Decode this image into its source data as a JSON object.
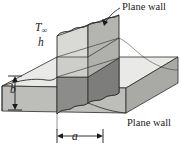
{
  "figure": {
    "width": 181,
    "height": 151,
    "background": "#ffffff"
  },
  "labels": {
    "plane_wall_top": "Plane wall",
    "plane_wall_bottom": "Plane wall",
    "t_infinity_symbol": "T",
    "t_infinity_subscript": "∞",
    "h_symbol": "h",
    "dimension_b": "b",
    "dimension_a": "a"
  },
  "annotations": {
    "leader_top_target": "top face of vertical plane wall",
    "dimension_b_meaning": "thickness of horizontal plane wall",
    "dimension_a_meaning": "thickness of vertical plane wall"
  },
  "colors": {
    "outline": "#1a1a1a",
    "face_light": "#e4e4e2",
    "face_mid": "#cfcfcc",
    "face_medium": "#b8b8b5",
    "face_dark": "#8f8f8d",
    "face_darker": "#7e7e7c",
    "text": "#1a1a1a",
    "background": "#ffffff"
  }
}
